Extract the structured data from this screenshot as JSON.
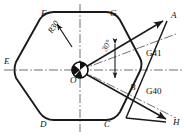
{
  "figure": {
    "origin_label": "O",
    "stroke_color": "#1a1a1a",
    "centerline_color": "#444444",
    "background": "#ffffff"
  },
  "vertices": [
    {
      "id": "E",
      "label": "E",
      "x": 16,
      "y": 62
    },
    {
      "id": "F",
      "label": "F",
      "x": 45,
      "y": 14
    },
    {
      "id": "G",
      "label": "G",
      "x": 114,
      "y": 14
    },
    {
      "id": "C",
      "label": "C",
      "x": 108,
      "y": 123
    },
    {
      "id": "D",
      "label": "D",
      "x": 44,
      "y": 123
    }
  ],
  "points": [
    {
      "id": "A",
      "label": "A",
      "x": 168,
      "y": 17
    },
    {
      "id": "B",
      "label": "B",
      "x": 133,
      "y": 89
    },
    {
      "id": "H",
      "label": "H",
      "x": 170,
      "y": 122
    }
  ],
  "gcodes": [
    {
      "id": "G41",
      "label": "G41",
      "x": 149,
      "y": 54
    },
    {
      "id": "G40",
      "label": "G40",
      "x": 149,
      "y": 92
    }
  ],
  "dimensions": [
    {
      "id": "radius",
      "label": "R30",
      "x": 53,
      "y": 31,
      "rotation": -58
    },
    {
      "id": "angle",
      "label": "30",
      "unit": "°",
      "x": 107,
      "y": 50,
      "rotation": -62
    }
  ],
  "center": {
    "label": "O",
    "x": 80,
    "y": 70,
    "radius": 8,
    "fill": "#111111"
  }
}
